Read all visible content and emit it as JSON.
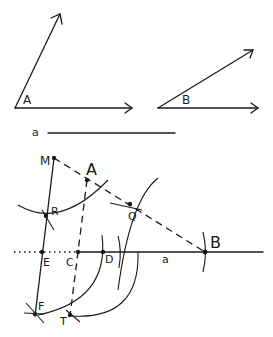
{
  "figure": {
    "given_angle_A": {
      "label": "A"
    },
    "given_angle_B": {
      "label": "B"
    },
    "given_segment": {
      "label": "a"
    },
    "construction": {
      "points": {
        "M": "M",
        "A": "A",
        "R": "R",
        "Q": "Q",
        "E": "E",
        "C": "C",
        "D": "D",
        "B": "B",
        "F": "F",
        "T": "T"
      },
      "segment_label": "a"
    }
  }
}
